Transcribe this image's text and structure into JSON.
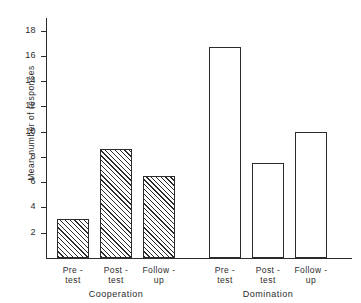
{
  "chart_data": {
    "type": "bar",
    "title": "",
    "subtitle": "",
    "xlabel": "",
    "ylabel": "Mean number of responses",
    "ylim": [
      0,
      19
    ],
    "yticks": [
      2,
      4,
      6,
      8,
      10,
      12,
      14,
      16,
      18
    ],
    "ytick_labels": [
      "2",
      "4",
      "6",
      "8",
      "10",
      "12",
      "14",
      "16",
      "18"
    ],
    "grid": false,
    "legend": "none",
    "categories": [
      "Pre-test",
      "Post-test",
      "Follow-up",
      "Pre-test",
      "Post-test",
      "Follow-up"
    ],
    "groups": [
      {
        "name": "Cooperation",
        "fill": "hatched",
        "categories": [
          "Pre-test",
          "Post-test",
          "Follow-up"
        ],
        "values": [
          3.1,
          8.6,
          6.5
        ]
      },
      {
        "name": "Domination",
        "fill": "open",
        "categories": [
          "Pre-test",
          "Post-test",
          "Follow-up"
        ],
        "values": [
          16.7,
          7.5,
          10.0
        ]
      }
    ],
    "bars": [
      {
        "id": "coop-pre",
        "group": "Cooperation",
        "label_line1": "Pre -",
        "label_line2": "test",
        "value": 3.1,
        "fill": "hatched"
      },
      {
        "id": "coop-post",
        "group": "Cooperation",
        "label_line1": "Post -",
        "label_line2": "test",
        "value": 8.6,
        "fill": "hatched"
      },
      {
        "id": "coop-fup",
        "group": "Cooperation",
        "label_line1": "Follow -",
        "label_line2": "up",
        "value": 6.5,
        "fill": "hatched"
      },
      {
        "id": "dom-pre",
        "group": "Domination",
        "label_line1": "Pre -",
        "label_line2": "test",
        "value": 16.7,
        "fill": "open"
      },
      {
        "id": "dom-post",
        "group": "Domination",
        "label_line1": "Post -",
        "label_line2": "test",
        "value": 7.5,
        "fill": "open"
      },
      {
        "id": "dom-fup",
        "group": "Domination",
        "label_line1": "Follow -",
        "label_line2": "up",
        "value": 10.0,
        "fill": "open"
      }
    ],
    "colors": {
      "axis": "#2b2b2b",
      "bar_outline": "#2b2b2b",
      "hatch": "#2b2b2b",
      "background": "#ffffff"
    }
  }
}
